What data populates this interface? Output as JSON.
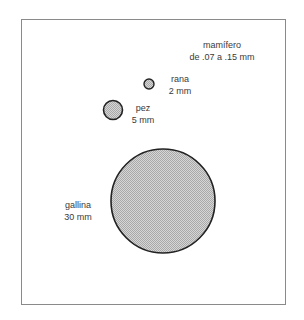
{
  "diagram": {
    "frame_color": "#8a8a8a",
    "outline_color": "#222222",
    "fill_color": "#c8c8c8",
    "eggs": [
      {
        "id": "mamifero",
        "name": "mamífero",
        "size": "de .07 a .15 mm",
        "drawn": false
      },
      {
        "id": "rana",
        "name": "rana",
        "size": "2 mm",
        "cx": 149,
        "cy": 84,
        "r": 5
      },
      {
        "id": "pez",
        "name": "pez",
        "size": "5 mm",
        "cx": 113,
        "cy": 110,
        "r": 10
      },
      {
        "id": "gallina",
        "name": "gallina",
        "size": "30 mm",
        "cx": 163,
        "cy": 201,
        "r": 52
      }
    ]
  }
}
